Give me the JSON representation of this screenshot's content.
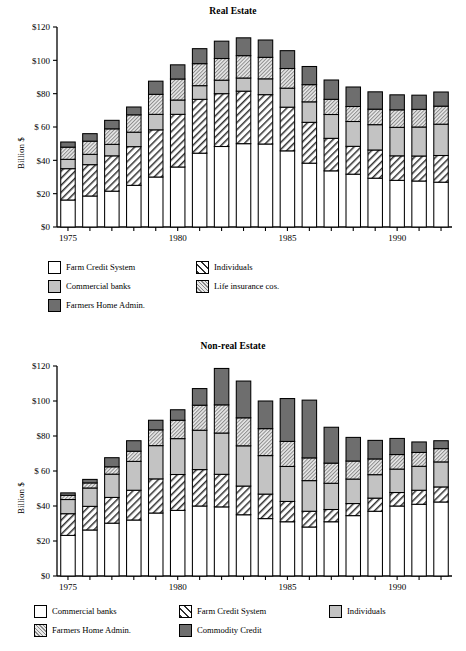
{
  "figure": {
    "ylabel": "Billion $",
    "unit": "Billion $"
  },
  "charts": [
    {
      "id": "real-estate",
      "title": "Real Estate",
      "ylabel": "Billion $",
      "ytick_labels": [
        "$120",
        "$100",
        "$80",
        "$ 60",
        "$40",
        "$20",
        "$0"
      ],
      "xtick_labels": [
        "1975",
        "1980",
        "1985",
        "1990"
      ],
      "legend": [
        {
          "label": "Farm Credit System",
          "fill": "white"
        },
        {
          "label": "Individuals",
          "fill": "diagonal"
        },
        {
          "label": "Commercial banks",
          "fill": "lightgray"
        },
        {
          "label": "Life insurance cos.",
          "fill": "finehatch"
        },
        {
          "label": "Farmers Home Admin.",
          "fill": "darkgray"
        }
      ]
    },
    {
      "id": "non-real-estate",
      "title": "Non-real Estate",
      "ylabel": "Billion $",
      "ytick_labels": [
        "$120",
        "$100",
        "$80",
        "$ 60",
        "$40",
        "$20",
        "$0"
      ],
      "xtick_labels": [
        "1975",
        "1980",
        "1985",
        "1990"
      ],
      "legend": [
        {
          "label": "Commercial banks",
          "fill": "white"
        },
        {
          "label": "Farm Credit System",
          "fill": "diagonal"
        },
        {
          "label": "Individuals",
          "fill": "lightgray"
        },
        {
          "label": "Farmers Home Admin.",
          "fill": "finehatch"
        },
        {
          "label": "Commodity Credit",
          "fill": "darkgray"
        }
      ]
    }
  ],
  "chart_data": [
    {
      "type": "bar",
      "stacked": true,
      "title": "Real Estate",
      "xlabel": "",
      "ylabel": "Billion $",
      "ylim": [
        0,
        120
      ],
      "yticks": [
        0,
        20,
        40,
        60,
        80,
        100,
        120
      ],
      "ytick_labels": [
        "$0",
        "$20",
        "$40",
        "$ 60",
        "$80",
        "$100",
        "$120"
      ],
      "grid": false,
      "legend_position": "below",
      "categories": [
        1975,
        1976,
        1977,
        1978,
        1979,
        1980,
        1981,
        1982,
        1983,
        1984,
        1985,
        1986,
        1987,
        1988,
        1989,
        1990,
        1991,
        1992
      ],
      "series": [
        {
          "name": "Farm Credit System",
          "fill": "white",
          "values": [
            16.2,
            18.6,
            21.5,
            25.0,
            30.0,
            36.0,
            44.3,
            48.3,
            50.0,
            49.8,
            45.7,
            38.3,
            33.7,
            31.7,
            29.3,
            28.0,
            27.6,
            26.9
          ]
        },
        {
          "name": "Individuals",
          "fill": "diagonal",
          "values": [
            18.8,
            18.8,
            21.2,
            23.2,
            28.3,
            31.6,
            32.3,
            31.7,
            31.5,
            29.6,
            26.2,
            24.5,
            19.5,
            16.7,
            16.9,
            14.7,
            15.0,
            16.0
          ]
        },
        {
          "name": "Commercial banks",
          "fill": "lightgray",
          "values": [
            5.6,
            6.2,
            6.9,
            8.7,
            9.3,
            8.6,
            8.2,
            8.1,
            7.9,
            9.5,
            11.4,
            12.3,
            14.3,
            14.9,
            15.2,
            17.1,
            17.4,
            18.8
          ]
        },
        {
          "name": "Life insurance cos.",
          "fill": "finehatch",
          "values": [
            7.3,
            7.9,
            9.3,
            10.4,
            12.0,
            12.6,
            13.2,
            13.0,
            13.4,
            12.9,
            11.8,
            10.3,
            9.1,
            9.0,
            9.3,
            10.5,
            10.6,
            10.8
          ]
        },
        {
          "name": "Farmers Home Admin.",
          "fill": "darkgray",
          "values": [
            3.1,
            4.5,
            5.1,
            4.7,
            7.9,
            8.5,
            9.0,
            10.4,
            10.7,
            10.4,
            10.7,
            10.9,
            11.6,
            11.7,
            10.4,
            9.0,
            8.5,
            8.5
          ]
        }
      ]
    },
    {
      "type": "bar",
      "stacked": true,
      "title": "Non-real Estate",
      "xlabel": "",
      "ylabel": "Billion $",
      "ylim": [
        0,
        120
      ],
      "yticks": [
        0,
        20,
        40,
        60,
        80,
        100,
        120
      ],
      "ytick_labels": [
        "$0",
        "$20",
        "$40",
        "$ 60",
        "$80",
        "$100",
        "$120"
      ],
      "grid": false,
      "legend_position": "below",
      "categories": [
        1975,
        1976,
        1977,
        1978,
        1979,
        1980,
        1981,
        1982,
        1983,
        1984,
        1985,
        1986,
        1987,
        1988,
        1989,
        1990,
        1991,
        1992
      ],
      "series": [
        {
          "name": "Commercial banks",
          "fill": "white",
          "values": [
            23.2,
            26.3,
            30.2,
            32.0,
            36.0,
            37.5,
            40.0,
            39.5,
            35.0,
            32.8,
            31.0,
            28.0,
            31.0,
            34.5,
            37.0,
            40.0,
            41.0,
            42.3
          ]
        },
        {
          "name": "Farm Credit System",
          "fill": "diagonal",
          "values": [
            12.4,
            13.5,
            14.7,
            17.0,
            19.5,
            20.5,
            20.8,
            18.6,
            16.4,
            14.0,
            11.6,
            9.0,
            7.0,
            6.9,
            7.5,
            7.7,
            8.0,
            8.6
          ]
        },
        {
          "name": "Individuals",
          "fill": "lightgray",
          "values": [
            8.1,
            10.5,
            13.3,
            16.5,
            19.0,
            20.5,
            22.5,
            23.6,
            23.0,
            22.0,
            20.0,
            17.5,
            15.0,
            14.0,
            13.4,
            13.4,
            13.7,
            14.3
          ]
        },
        {
          "name": "Farmers Home Admin.",
          "fill": "finehatch",
          "values": [
            2.4,
            2.9,
            4.2,
            5.8,
            9.0,
            10.5,
            14.3,
            16.1,
            16.0,
            15.4,
            14.3,
            13.0,
            11.5,
            10.3,
            9.0,
            8.3,
            7.9,
            7.6
          ]
        },
        {
          "name": "Commodity Credit",
          "fill": "darkgray",
          "values": [
            1.4,
            2.0,
            5.2,
            6.0,
            5.5,
            6.0,
            9.5,
            20.8,
            21.0,
            15.8,
            24.5,
            33.0,
            20.5,
            13.5,
            10.6,
            9.2,
            6.0,
            4.5
          ]
        }
      ]
    }
  ]
}
